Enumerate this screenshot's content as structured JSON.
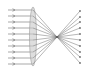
{
  "diagram": {
    "type": "optics-ray-diagram",
    "ray_count": 10,
    "ray_color": "#6f6f6f",
    "lens_color": "#9a9a9a",
    "lens_fill": "#c8c8c8",
    "background": "#ffffff",
    "rays_y": [
      10,
      16,
      22,
      28,
      34,
      40,
      46,
      52,
      58,
      64
    ],
    "incoming_start_x": 8,
    "lens_x": 33,
    "focal_point": {
      "x": 57,
      "y": 37
    },
    "outgoing_end_x": 80,
    "outgoing_end_y": [
      11,
      17,
      22,
      28,
      34,
      40,
      46,
      52,
      57,
      63
    ]
  }
}
